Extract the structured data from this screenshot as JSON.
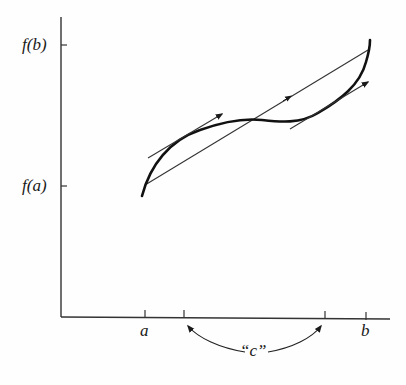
{
  "diagram": {
    "y_labels": {
      "fb": "f(b)",
      "fa": "f(a)"
    },
    "x_labels": {
      "a": "a",
      "b": "b",
      "c": "“c”"
    },
    "colors": {
      "ink": "#1a1a1a",
      "thin_line": "#333333",
      "background": "#fefefe"
    },
    "elements": [
      "y-axis",
      "x-axis",
      "function-curve",
      "secant-line",
      "tangent-line-1",
      "tangent-line-2",
      "c-indicator-arc"
    ]
  }
}
